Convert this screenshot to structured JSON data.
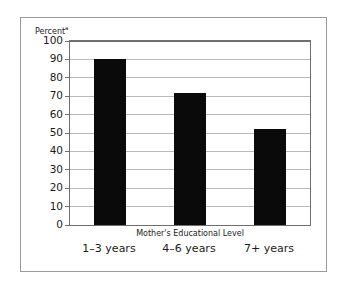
{
  "chart_data": {
    "type": "bar",
    "title": "",
    "subtitle": "",
    "xlabel": "Mother's Educational Level",
    "ylabel": "Percent",
    "ylabel_superscript": "a",
    "categories": [
      "1–3 years",
      "4–6 years",
      "7+ years"
    ],
    "values": [
      90,
      72,
      52
    ],
    "ylim": [
      0,
      100
    ],
    "ytick_step": 10,
    "yticks": [
      100,
      90,
      80,
      70,
      60,
      50,
      40,
      30,
      20,
      10,
      0
    ],
    "ytick_labels": [
      "100",
      "90",
      "80",
      "70",
      "60",
      "50",
      "40",
      "30",
      "20",
      "10",
      "0"
    ],
    "grid": true,
    "grid_axis": "y",
    "legend": null,
    "legend_position": "none",
    "series": [
      {
        "name": "Percent",
        "values": [
          90,
          72,
          52
        ],
        "color": "#0a0a0a"
      }
    ],
    "annotations": []
  },
  "colors": {
    "bar": "#0a0a0a",
    "gridline": "#b9b9b9",
    "axis": "#6f6f6f",
    "frame": "#9a9a9a",
    "background": "#ffffff",
    "text": "#1a1a1a"
  }
}
